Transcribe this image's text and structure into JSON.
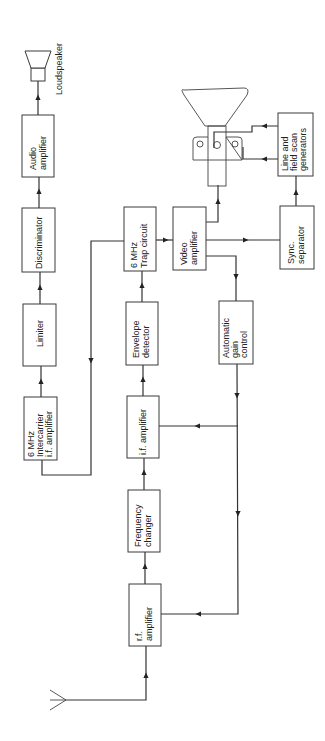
{
  "diagram": {
    "orientation": "rotated 90 degrees counter-clockwise",
    "blocks": {
      "audio_amplifier": [
        "Audio",
        "amplifier"
      ],
      "discriminator": [
        "Discriminator"
      ],
      "limiter": [
        "Limiter"
      ],
      "intercarrier_if": [
        "6 MHz",
        "Intercarrier",
        "i.f. amplifier"
      ],
      "trap_circuit": [
        "6 MHz",
        "Trap circuit"
      ],
      "envelope_detector": [
        "Envelope",
        "detector"
      ],
      "if_amplifier": [
        "i.f. amplifier"
      ],
      "frequency_changer": [
        "Frequency",
        "changer"
      ],
      "rf_amplifier": [
        "r.f.",
        "amplifier"
      ],
      "video_amplifier": [
        "Video",
        "amplifier"
      ],
      "agc": [
        "Automatic",
        "gain",
        "control"
      ],
      "sync_separator": [
        "Sync.",
        "separator"
      ],
      "scan_generators": [
        "Line and",
        "field scan",
        "generators"
      ]
    },
    "labels": {
      "loudspeaker": "Loudspeaker"
    },
    "components": [
      "antenna",
      "loudspeaker",
      "cathode-ray-tube"
    ],
    "connections": [
      [
        "antenna",
        "rf_amplifier"
      ],
      [
        "rf_amplifier",
        "frequency_changer"
      ],
      [
        "frequency_changer",
        "if_amplifier"
      ],
      [
        "if_amplifier",
        "envelope_detector"
      ],
      [
        "envelope_detector",
        "trap_circuit"
      ],
      [
        "trap_circuit",
        "video_amplifier"
      ],
      [
        "trap_circuit",
        "intercarrier_if"
      ],
      [
        "intercarrier_if",
        "limiter"
      ],
      [
        "limiter",
        "discriminator"
      ],
      [
        "discriminator",
        "audio_amplifier"
      ],
      [
        "audio_amplifier",
        "loudspeaker"
      ],
      [
        "video_amplifier",
        "cathode-ray-tube"
      ],
      [
        "video_amplifier",
        "sync_separator"
      ],
      [
        "video_amplifier",
        "agc"
      ],
      [
        "agc",
        "if_amplifier"
      ],
      [
        "agc",
        "rf_amplifier"
      ],
      [
        "sync_separator",
        "scan_generators"
      ],
      [
        "scan_generators",
        "cathode-ray-tube"
      ]
    ]
  }
}
